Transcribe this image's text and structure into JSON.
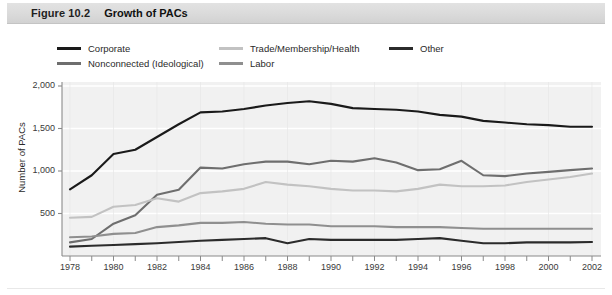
{
  "figure": {
    "number": "Figure 10.2",
    "title": "Growth of PACs"
  },
  "legend": {
    "position": "above-plot",
    "items": [
      {
        "key": "corporate",
        "label": "Corporate",
        "color": "#1a1a1a"
      },
      {
        "key": "nonconnected",
        "label": "Nonconnected (Ideological)",
        "color": "#6e6e6e"
      },
      {
        "key": "trade",
        "label": "Trade/Membership/Health",
        "color": "#c2c2c2"
      },
      {
        "key": "labor",
        "label": "Labor",
        "color": "#8f8f8f"
      },
      {
        "key": "other",
        "label": "Other",
        "color": "#2b2b2b"
      }
    ]
  },
  "axes": {
    "y_title": "Number of PACs",
    "y_ticks": [
      "500",
      "1,000",
      "1,500",
      "2,000"
    ],
    "x_ticks": [
      "1978",
      "1980",
      "1982",
      "1984",
      "1986",
      "1988",
      "1990",
      "1992",
      "1994",
      "1996",
      "1998",
      "2000",
      "2002"
    ]
  },
  "colors": {
    "plot_background": "#f1f1f1",
    "gridline": "#ffffff",
    "axis": "#8a8a8a",
    "title_bar": "#dcdcdc",
    "text": "#2a2a2a"
  },
  "chart_data": {
    "type": "line",
    "title": "Growth of PACs",
    "xlabel": "",
    "ylabel": "Number of PACs",
    "xlim": [
      1978,
      2002
    ],
    "ylim": [
      0,
      2000
    ],
    "grid": true,
    "legend_position": "top",
    "x": [
      1978,
      1979,
      1980,
      1981,
      1982,
      1983,
      1984,
      1985,
      1986,
      1987,
      1988,
      1989,
      1990,
      1991,
      1992,
      1993,
      1994,
      1995,
      1996,
      1997,
      1998,
      1999,
      2000,
      2001,
      2002
    ],
    "series": [
      {
        "name": "Corporate",
        "color": "#1a1a1a",
        "values": [
          785,
          950,
          1200,
          1250,
          1400,
          1550,
          1690,
          1700,
          1730,
          1770,
          1800,
          1820,
          1790,
          1740,
          1730,
          1720,
          1700,
          1660,
          1640,
          1590,
          1570,
          1550,
          1540,
          1520,
          1520
        ]
      },
      {
        "name": "Nonconnected (Ideological)",
        "color": "#6e6e6e",
        "values": [
          160,
          200,
          380,
          480,
          720,
          780,
          1040,
          1030,
          1080,
          1110,
          1110,
          1080,
          1120,
          1110,
          1150,
          1100,
          1010,
          1020,
          1120,
          950,
          940,
          970,
          990,
          1010,
          1030
        ]
      },
      {
        "name": "Trade/Membership/Health",
        "color": "#c2c2c2",
        "values": [
          450,
          460,
          580,
          600,
          680,
          640,
          740,
          760,
          790,
          870,
          840,
          820,
          790,
          770,
          770,
          760,
          790,
          840,
          820,
          820,
          830,
          870,
          900,
          930,
          970
        ]
      },
      {
        "name": "Labor",
        "color": "#8f8f8f",
        "values": [
          220,
          230,
          260,
          270,
          340,
          360,
          390,
          390,
          400,
          380,
          370,
          370,
          350,
          350,
          350,
          340,
          340,
          340,
          330,
          320,
          320,
          320,
          320,
          320,
          320
        ]
      },
      {
        "name": "Other",
        "color": "#2b2b2b",
        "values": [
          110,
          120,
          130,
          140,
          150,
          165,
          180,
          190,
          200,
          210,
          150,
          200,
          190,
          190,
          190,
          190,
          200,
          210,
          180,
          150,
          150,
          160,
          160,
          160,
          165
        ]
      }
    ]
  }
}
